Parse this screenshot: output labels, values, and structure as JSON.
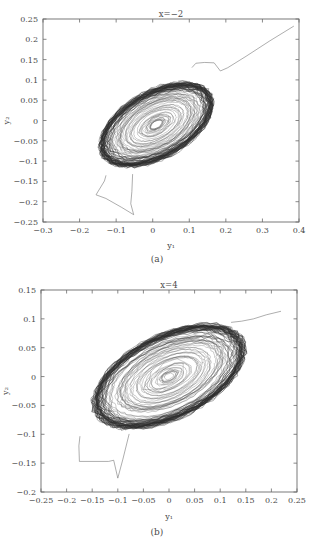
{
  "figure": {
    "background_color": "#ffffff",
    "line_color": "#3d3d3d",
    "axis_color": "#6b6b6b"
  },
  "panels": [
    {
      "caption": "(a)",
      "title": "x=−2",
      "xlabel": "y₁",
      "ylabel": "y₂",
      "xticks": [
        "−0.3",
        "−0.2",
        "−0.1",
        "0",
        "0.1",
        "0.2",
        "0.3",
        "0.4"
      ],
      "yticks": [
        "0.25",
        "0.2",
        "0.15",
        "0.1",
        "0.05",
        "0",
        "−0.05",
        "−0.1",
        "−0.15",
        "−0.2",
        "−0.25"
      ]
    },
    {
      "caption": "(b)",
      "title": "x=4",
      "xlabel": "y₁",
      "ylabel": "y₂",
      "xticks": [
        "−0.25",
        "−0.2",
        "−0.15",
        "−0.1",
        "−0.05",
        "0",
        "0.05",
        "0.1",
        "0.15",
        "0.2",
        "0.25"
      ],
      "yticks": [
        "0.15",
        "0.1",
        "0.05",
        "0",
        "−0.05",
        "−0.1",
        "−0.15",
        "−0.2"
      ]
    }
  ],
  "chart_data": [
    {
      "type": "line",
      "title": "x=−2",
      "xlabel": "y₁",
      "ylabel": "y₂",
      "xlim": [
        -0.3,
        0.4
      ],
      "ylim": [
        -0.25,
        0.25
      ],
      "xtick_values": [
        -0.3,
        -0.2,
        -0.1,
        0,
        0.1,
        0.2,
        0.3,
        0.4
      ],
      "ytick_values": [
        0.25,
        0.2,
        0.15,
        0.1,
        0.05,
        0,
        -0.05,
        -0.1,
        -0.15,
        -0.2,
        -0.25
      ],
      "grid": false,
      "legend": "none",
      "description": "Chaotic phase-portrait attractor: dense quasi-elliptical band of trajectories tilted about 25 degrees counter-clockwise, centred near (0.01, -0.01), outer envelope spanning roughly y1 in [-0.28, 0.29] and y2 in [-0.14, 0.145]; a straight transient line enters from (0.385, 0.23) down to (0.19, 0.115) and a second transient tail descends from (-0.13, -0.135) through (-0.155, -0.195) to (-0.05, -0.232) and back up to (-0.05, -0.135).",
      "attractor": {
        "center": [
          0.01,
          -0.01
        ],
        "radius_x": 0.165,
        "radius_y": 0.082,
        "tilt_deg": 25,
        "rings": 46,
        "points_per_ring": 78,
        "radial_jitter": 0.055,
        "inner_shrink": 0.12
      },
      "transients": [
        [
          [
            0.385,
            0.232
          ],
          [
            0.32,
            0.196
          ],
          [
            0.255,
            0.158
          ],
          [
            0.205,
            0.13
          ],
          [
            0.185,
            0.122
          ],
          [
            0.168,
            0.142
          ],
          [
            0.142,
            0.143
          ],
          [
            0.118,
            0.141
          ],
          [
            0.108,
            0.131
          ]
        ],
        [
          [
            -0.055,
            -0.133
          ],
          [
            -0.057,
            -0.175
          ],
          [
            -0.06,
            -0.205
          ],
          [
            -0.052,
            -0.232
          ],
          [
            -0.085,
            -0.214
          ],
          [
            -0.128,
            -0.192
          ],
          [
            -0.155,
            -0.183
          ],
          [
            -0.132,
            -0.149
          ],
          [
            -0.128,
            -0.136
          ]
        ]
      ]
    },
    {
      "type": "line",
      "title": "x=4",
      "xlabel": "y₁",
      "ylabel": "y₂",
      "xlim": [
        -0.25,
        0.25
      ],
      "ylim": [
        -0.2,
        0.15
      ],
      "xtick_values": [
        -0.25,
        -0.2,
        -0.15,
        -0.1,
        -0.05,
        0,
        0.05,
        0.1,
        0.15,
        0.2,
        0.25
      ],
      "ytick_values": [
        0.15,
        0.1,
        0.05,
        0,
        -0.05,
        -0.1,
        -0.15,
        -0.2
      ],
      "grid": false,
      "legend": "none",
      "description": "Chaotic phase-portrait attractor: dense quasi-elliptical band tilted about 22 degrees counter-clockwise, centred near (0.0, 0.0), outer envelope spanning roughly y1 in [-0.235, 0.235] and y2 in [-0.108, 0.108]; a short transient enters at the upper right near (0.215, 0.112) and a V-shaped transient tail drops from (-0.175, -0.103) through (-0.175, -0.147) to (-0.1, -0.176) back up to (-0.077, -0.1).",
      "attractor": {
        "center": [
          0.0,
          0.0
        ],
        "radius_x": 0.155,
        "radius_y": 0.072,
        "tilt_deg": 22,
        "rings": 48,
        "points_per_ring": 80,
        "radial_jitter": 0.05,
        "inner_shrink": 0.1
      },
      "transients": [
        [
          [
            0.218,
            0.113
          ],
          [
            0.19,
            0.107
          ],
          [
            0.165,
            0.1
          ],
          [
            0.142,
            0.096
          ],
          [
            0.122,
            0.094
          ]
        ],
        [
          [
            -0.078,
            -0.1
          ],
          [
            -0.09,
            -0.143
          ],
          [
            -0.1,
            -0.176
          ],
          [
            -0.108,
            -0.145
          ],
          [
            -0.118,
            -0.147
          ],
          [
            -0.175,
            -0.147
          ],
          [
            -0.176,
            -0.12
          ],
          [
            -0.174,
            -0.104
          ]
        ]
      ]
    }
  ]
}
